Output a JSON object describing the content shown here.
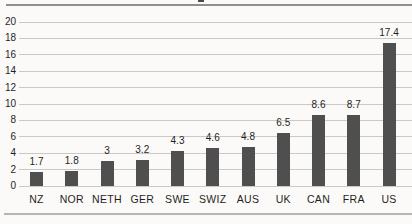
{
  "chart_data": {
    "type": "bar",
    "categories": [
      "NZ",
      "NOR",
      "NETH",
      "GER",
      "SWE",
      "SWIZ",
      "AUS",
      "UK",
      "CAN",
      "FRA",
      "US"
    ],
    "values": [
      1.7,
      1.8,
      3,
      3.2,
      4.3,
      4.6,
      4.8,
      6.5,
      8.6,
      8.7,
      17.4
    ],
    "value_labels": [
      "1.7",
      "1.8",
      "3",
      "3.2",
      "4.3",
      "4.6",
      "4.8",
      "6.5",
      "8.6",
      "8.7",
      "17.4"
    ],
    "title": "",
    "xlabel": "",
    "ylabel": "",
    "ylim": [
      0,
      20
    ],
    "y_ticks": [
      0,
      2,
      4,
      6,
      8,
      10,
      12,
      14,
      16,
      18,
      20
    ],
    "grid": "horizontal",
    "legend": "none",
    "colors": {
      "bar": "#4f4f4f",
      "gridline": "#c9c9c6",
      "text": "#1f1f1f",
      "top_rule": "#8f8f8c",
      "bottom_rule": "#b5b5b2",
      "title_remnant": "#4a4a4a",
      "background": "#fbfaf8"
    }
  }
}
